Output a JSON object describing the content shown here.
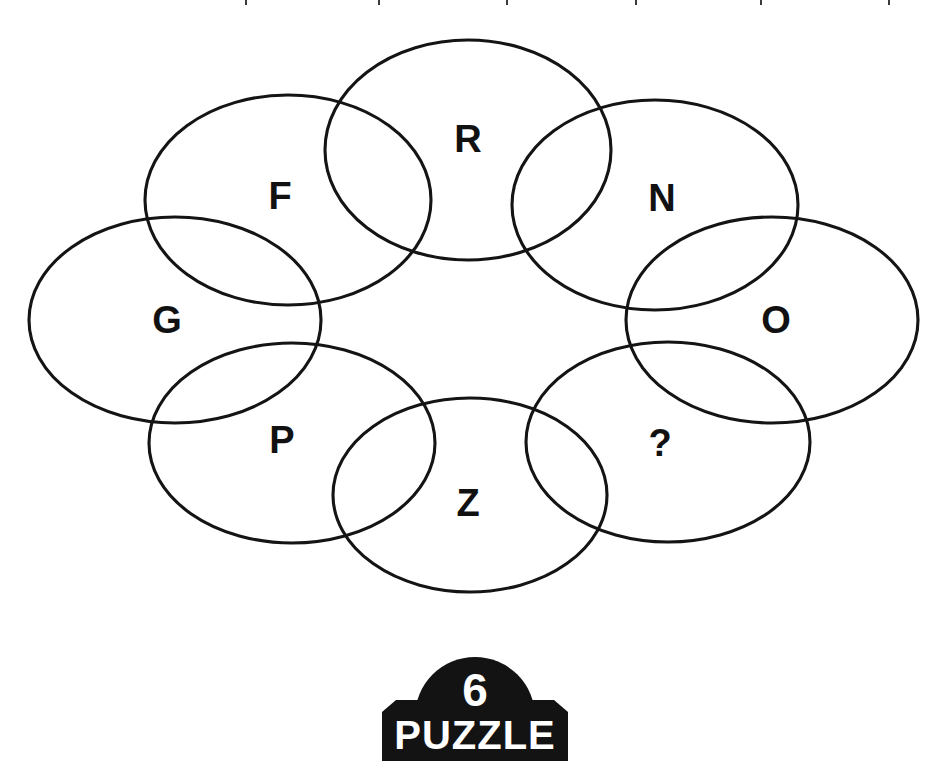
{
  "puzzle": {
    "type": "letter-ring-ellipses",
    "shape_count": 8,
    "stroke_color": "#141414",
    "background_color": "#ffffff",
    "text_color": "#111111",
    "missing_marker": "?",
    "cells": [
      {
        "id": "cell-r",
        "label": "R",
        "cx": 468,
        "cy": 150,
        "rx": 143,
        "ry": 110,
        "text_x": 468,
        "text_y": 139
      },
      {
        "id": "cell-n",
        "label": "N",
        "cx": 655,
        "cy": 205,
        "rx": 143,
        "ry": 105,
        "text_x": 662,
        "text_y": 198
      },
      {
        "id": "cell-o",
        "label": "O",
        "cx": 772,
        "cy": 320,
        "rx": 146,
        "ry": 103,
        "text_x": 776,
        "text_y": 320
      },
      {
        "id": "cell-q",
        "label": "?",
        "cx": 668,
        "cy": 442,
        "rx": 142,
        "ry": 100,
        "text_x": 660,
        "text_y": 443
      },
      {
        "id": "cell-z",
        "label": "Z",
        "cx": 470,
        "cy": 495,
        "rx": 137,
        "ry": 97,
        "text_x": 468,
        "text_y": 503
      },
      {
        "id": "cell-p",
        "label": "P",
        "cx": 292,
        "cy": 443,
        "rx": 143,
        "ry": 100,
        "text_x": 282,
        "text_y": 440
      },
      {
        "id": "cell-g",
        "label": "G",
        "cx": 175,
        "cy": 320,
        "rx": 146,
        "ry": 103,
        "text_x": 167,
        "text_y": 320
      },
      {
        "id": "cell-f",
        "label": "F",
        "cx": 288,
        "cy": 200,
        "rx": 143,
        "ry": 105,
        "text_x": 280,
        "text_y": 196
      }
    ],
    "sequence_clockwise": [
      "R",
      "N",
      "O",
      "?",
      "Z",
      "P",
      "G",
      "F"
    ]
  },
  "badge": {
    "number": "6",
    "word": "PUZZLE",
    "fill_color": "#131313",
    "text_color": "#ffffff"
  },
  "top_ticks": {
    "positions": [
      245,
      378,
      506,
      635,
      760,
      888
    ]
  }
}
